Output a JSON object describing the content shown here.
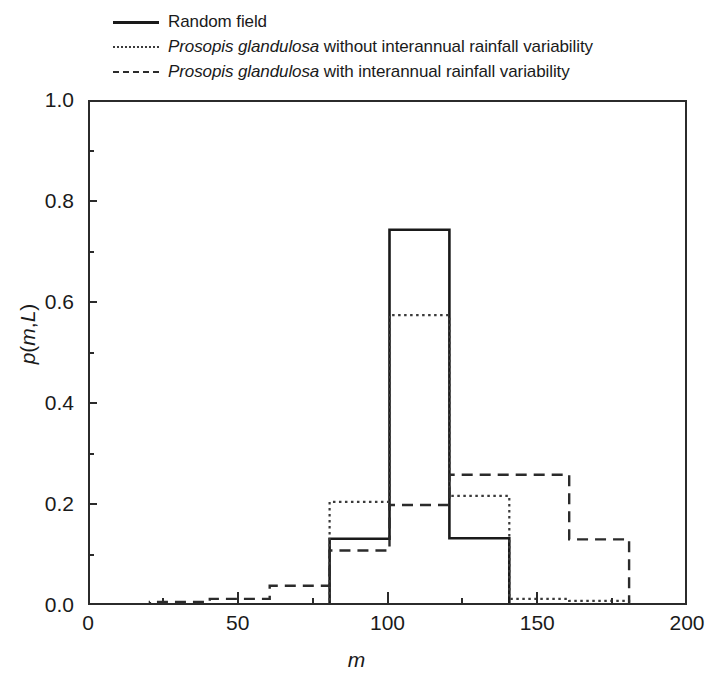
{
  "legend": {
    "position": "above-axes-left",
    "entries": [
      {
        "key": "solid",
        "label": "Random field",
        "italic_prefix": ""
      },
      {
        "key": "dotted",
        "label": "Prosopis glandulosa without interannual rainfall variability",
        "italic_prefix": "Prosopis glandulosa",
        "rest": " without interannual rainfall variability"
      },
      {
        "key": "dashed",
        "label": "Prosopis glandulosa with interannual rainfall variability",
        "italic_prefix": "Prosopis glandulosa",
        "rest": " with interannual rainfall variability"
      }
    ]
  },
  "axes": {
    "x": {
      "label": "m",
      "min": 0,
      "max": 200,
      "major_ticks": [
        0,
        50,
        100,
        150,
        200
      ],
      "major_tick_labels": [
        "0",
        "50",
        "100",
        "150",
        "200"
      ],
      "minor_ticks": [
        25,
        75,
        125,
        175
      ]
    },
    "y": {
      "label": "p(m,L)",
      "label_parts": [
        "p",
        "(",
        "m",
        ",",
        "L",
        ")"
      ],
      "min": 0.0,
      "max": 1.0,
      "major_ticks": [
        0.0,
        0.2,
        0.4,
        0.6,
        0.8,
        1.0
      ],
      "major_tick_labels": [
        "0.0",
        "0.2",
        "0.4",
        "0.6",
        "0.8",
        "1.0"
      ],
      "minor_ticks": [
        0.1,
        0.3,
        0.5,
        0.7,
        0.9
      ]
    },
    "grid": false,
    "frame": "box"
  },
  "colors": {
    "ink": "#1a1a1a",
    "frame": "#2b2b2b",
    "background": "#ffffff"
  },
  "chart_data": {
    "type": "bar",
    "subtype": "step-histogram",
    "title": "",
    "xlabel": "m",
    "ylabel": "p(m,L)",
    "xlim": [
      0,
      200
    ],
    "ylim": [
      0.0,
      1.0
    ],
    "grid": false,
    "legend_position": "above-left",
    "bin_edges": [
      0,
      20,
      40,
      60,
      80,
      100,
      120,
      140,
      160,
      180,
      200
    ],
    "categories": [
      "0-20",
      "20-40",
      "40-60",
      "60-80",
      "80-100",
      "100-120",
      "120-140",
      "140-160",
      "160-180",
      "180-200"
    ],
    "series": [
      {
        "name": "Random field",
        "style": "solid",
        "color": "#1a1a1a",
        "values": [
          0.0,
          0.0,
          0.0,
          0.0,
          0.135,
          0.747,
          0.136,
          0.0,
          0.0,
          0.0
        ]
      },
      {
        "name": "Prosopis glandulosa without interannual rainfall variability",
        "style": "dotted",
        "color": "#3a3a3a",
        "values": [
          0.0,
          0.0,
          0.0,
          0.0,
          0.208,
          0.578,
          0.22,
          0.016,
          0.012,
          0.0
        ]
      },
      {
        "name": "Prosopis glandulosa with interannual rainfall variability",
        "style": "dashed",
        "color": "#2b2b2b",
        "values": [
          0.0,
          0.01,
          0.016,
          0.042,
          0.112,
          0.202,
          0.262,
          0.262,
          0.134,
          0.0
        ]
      }
    ]
  }
}
